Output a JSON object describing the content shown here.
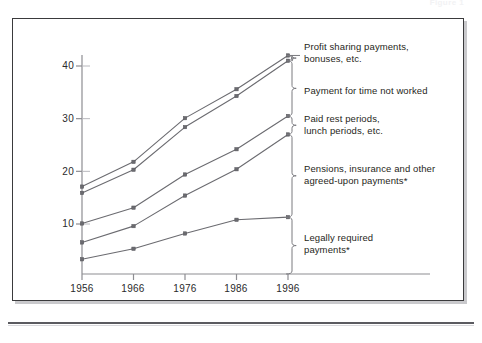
{
  "figure": {
    "cutoff_header": "Figure  1",
    "axis": {
      "y_ticks": [
        "10",
        "20",
        "30",
        "40"
      ],
      "y_values": [
        10,
        20,
        30,
        40
      ],
      "x_ticks": [
        "1956",
        "1966",
        "1976",
        "1986",
        "1996"
      ]
    }
  },
  "annotations": [
    {
      "id": "profit-sharing",
      "text": "Profit sharing payments,\nbonuses, etc."
    },
    {
      "id": "time-not-worked",
      "text": "Payment for time not worked"
    },
    {
      "id": "paid-rest",
      "text": "Paid rest periods,\nlunch periods, etc."
    },
    {
      "id": "pensions",
      "text": "Pensions, insurance and other\nagreed-upon payments*"
    },
    {
      "id": "legally-required",
      "text": "Legally required\npayments*"
    }
  ],
  "chart_data": {
    "type": "line",
    "title": "",
    "subtitle": "",
    "xlabel": "",
    "ylabel": "",
    "x": [
      1956,
      1966,
      1976,
      1986,
      1996
    ],
    "xlim": [
      1951,
      1999
    ],
    "ylim": [
      0,
      44
    ],
    "y_ticks": [
      10,
      20,
      30,
      40
    ],
    "grid": false,
    "legend_position": "right-braces",
    "marker": "square",
    "line_color": "#6b6b70",
    "note": "Cumulative boundary lines; right-hand braces label the band between adjacent lines.",
    "series": [
      {
        "name": "Total including profit sharing payments, bonuses, etc.",
        "values": [
          17.1,
          21.8,
          30.1,
          35.6,
          42.0
        ]
      },
      {
        "name": "Total through payment for time not worked",
        "values": [
          15.9,
          20.3,
          28.4,
          34.3,
          41.0
        ]
      },
      {
        "name": "Total through paid rest periods, lunch periods, etc.",
        "values": [
          10.1,
          13.1,
          19.4,
          24.2,
          30.5
        ]
      },
      {
        "name": "Total through pensions, insurance and other agreed-upon payments*",
        "values": [
          6.5,
          9.6,
          15.4,
          20.4,
          27.0
        ]
      },
      {
        "name": "Legally required payments*",
        "values": [
          3.3,
          5.3,
          8.2,
          10.8,
          11.3
        ]
      }
    ],
    "bands": [
      {
        "label": "Profit sharing payments, bonuses, etc.",
        "between": [
          0,
          1
        ]
      },
      {
        "label": "Payment for time not worked",
        "between": [
          1,
          2
        ]
      },
      {
        "label": "Paid rest periods, lunch periods, etc.",
        "between": [
          2,
          3
        ]
      },
      {
        "label": "Pensions, insurance and other agreed-upon payments*",
        "between": [
          3,
          4
        ]
      },
      {
        "label": "Legally required payments*",
        "between": [
          4,
          "axis"
        ]
      }
    ]
  }
}
